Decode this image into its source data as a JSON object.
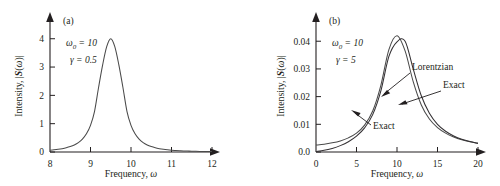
{
  "figure": {
    "background": "#ffffff",
    "curve_color": "#4a4a4a",
    "axis_color": "#231f20"
  },
  "chart_data": [
    {
      "type": "line",
      "panel_label": "(a)",
      "title": "",
      "xlabel": "Frequency, ω",
      "ylabel": "Intensity, |S(ω)|",
      "xlim": [
        8,
        12
      ],
      "ylim": [
        0,
        4.45
      ],
      "xticks": [
        8,
        9,
        10,
        11,
        12
      ],
      "xticklabels": [
        "8",
        "9",
        "10",
        "11",
        "12"
      ],
      "yticks": [
        0,
        1,
        2,
        3,
        4
      ],
      "yticklabels": [
        "0",
        "1",
        "2",
        "3",
        "4"
      ],
      "grid": false,
      "legend": "none",
      "annotations": [
        {
          "text": "ω",
          "sub": "0",
          "rest": " = 10"
        },
        {
          "text": "γ",
          "sub": "",
          "rest": " = 0.5"
        }
      ],
      "parameters": {
        "omega_0": 10,
        "gamma": 0.5,
        "peak_value": 4.0,
        "peak_position": 10
      },
      "series": [
        {
          "name": "Lorentzian",
          "x": [
            8.0,
            8.1,
            8.2,
            8.3,
            8.4,
            8.5,
            8.6,
            8.7,
            8.8,
            8.9,
            9.0,
            9.1,
            9.2,
            9.3,
            9.4,
            9.5,
            9.6,
            9.7,
            9.8,
            9.9,
            10.0,
            10.1,
            10.2,
            10.3,
            10.4,
            10.5,
            10.6,
            10.7,
            10.8,
            10.9,
            11.0,
            11.1,
            11.2,
            11.3,
            11.4,
            11.5,
            11.6,
            11.7,
            11.8,
            11.9,
            12.0
          ],
          "y": [
            0.062,
            0.076,
            0.094,
            0.118,
            0.149,
            0.191,
            0.249,
            0.332,
            0.455,
            0.641,
            0.941,
            1.438,
            2.286,
            3.077,
            3.721,
            4.0,
            3.721,
            3.077,
            2.286,
            1.438,
            0.941,
            0.641,
            0.455,
            0.332,
            0.249,
            0.191,
            0.149,
            0.118,
            0.094,
            0.076,
            0.062,
            0.052,
            0.044,
            0.037,
            0.032,
            0.027,
            0.024,
            0.021,
            0.018,
            0.016,
            0.014
          ]
        }
      ]
    },
    {
      "type": "line",
      "panel_label": "(b)",
      "title": "",
      "xlabel": "Frequency, ω",
      "ylabel": "Intensity, |S(ω)|",
      "xlim": [
        0,
        20
      ],
      "ylim": [
        0,
        0.0455
      ],
      "xticks": [
        0,
        5,
        10,
        15,
        20
      ],
      "xticklabels": [
        "0",
        "5",
        "10",
        "15",
        "20"
      ],
      "yticks": [
        0,
        0.01,
        0.02,
        0.03,
        0.04
      ],
      "yticklabels": [
        "0.0",
        "0.01",
        "0.02",
        "0.03",
        "0.04"
      ],
      "grid": false,
      "legend": "inline-annotations",
      "annotations": [
        {
          "text": "ω",
          "sub": "0",
          "rest": " = 10"
        },
        {
          "text": "γ",
          "sub": "",
          "rest": " = 5"
        }
      ],
      "curve_labels": [
        {
          "label": "Lorentzian",
          "x": 412,
          "y": 67
        },
        {
          "label": "Exact",
          "x": 443,
          "y": 85
        },
        {
          "label": "Exact",
          "x": 373,
          "y": 126
        }
      ],
      "parameters": {
        "omega_0": 10,
        "gamma": 5,
        "lorentzian_peak": 0.042,
        "exact_peak": 0.04
      },
      "series": [
        {
          "name": "Lorentzian",
          "x": [
            0,
            1,
            2,
            3,
            4,
            5,
            6,
            7,
            8,
            9,
            10,
            11,
            12,
            13,
            14,
            15,
            16,
            17,
            18,
            19,
            20
          ],
          "y": [
            0.0025,
            0.0028,
            0.0033,
            0.004,
            0.0051,
            0.0068,
            0.0097,
            0.0148,
            0.024,
            0.037,
            0.042,
            0.0365,
            0.0254,
            0.017,
            0.0119,
            0.0088,
            0.0068,
            0.0054,
            0.0044,
            0.0037,
            0.0032
          ]
        },
        {
          "name": "Exact",
          "x": [
            0,
            1,
            2,
            3,
            4,
            5,
            6,
            7,
            8,
            9,
            10,
            11,
            12,
            13,
            14,
            15,
            16,
            17,
            18,
            19,
            20
          ],
          "y": [
            0.0002,
            0.0006,
            0.0013,
            0.0023,
            0.0037,
            0.0057,
            0.0087,
            0.0135,
            0.022,
            0.0345,
            0.0398,
            0.04,
            0.03,
            0.0203,
            0.014,
            0.01,
            0.0075,
            0.0058,
            0.0046,
            0.0038,
            0.0031
          ]
        }
      ]
    }
  ]
}
